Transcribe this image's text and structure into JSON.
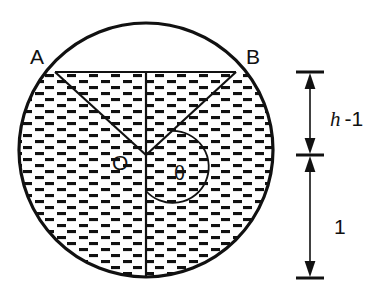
{
  "figure": {
    "type": "geometry-diagram",
    "background_color": "#ffffff",
    "ink_color": "#111111"
  },
  "labels": {
    "point_a": "A",
    "point_b": "B",
    "center_o": "O",
    "angle_theta": "θ",
    "dim_upper_italic": "h",
    "dim_upper_rest": "-1",
    "dim_lower": "1"
  },
  "geometry": {
    "circle": {
      "center_x": 146,
      "center_y": 150,
      "radius": 128,
      "stroke_width": 3.2
    },
    "chord_ab": {
      "x1": 55,
      "y1": 72,
      "x2": 236,
      "y2": 72
    },
    "vertical_diameter": {
      "x": 146,
      "y_top": 72,
      "y_bottom": 278
    },
    "radius_oa": {
      "x1": 146,
      "y1": 155,
      "x2": 55,
      "y2": 72
    },
    "radius_ob": {
      "x1": 146,
      "y1": 155,
      "x2": 236,
      "y2": 72
    },
    "theta_arc": {
      "center_x": 146,
      "center_y": 155,
      "radius": 36,
      "start_angle_deg": -42,
      "end_angle_deg": 90
    },
    "shaded_region": "circle minus the circular segment above chord AB",
    "hatch_pattern": "horizontal-dash-brick"
  },
  "dimension_scale": {
    "axis_x": 310,
    "top_tick_y": 72,
    "mid_tick_y": 155,
    "bottom_tick_y": 278,
    "segments": [
      {
        "name": "upper",
        "label": "h -1",
        "from_y": 72,
        "to_y": 155,
        "label_x": 330,
        "label_y": 118
      },
      {
        "name": "lower",
        "label": "1",
        "from_y": 155,
        "to_y": 278,
        "label_x": 330,
        "label_y": 226
      }
    ]
  },
  "label_positions": {
    "point_a": {
      "x": 30,
      "y": 64
    },
    "point_b": {
      "x": 246,
      "y": 64
    },
    "center_o": {
      "x": 112,
      "y": 170
    },
    "angle_theta": {
      "x": 174,
      "y": 180
    }
  }
}
